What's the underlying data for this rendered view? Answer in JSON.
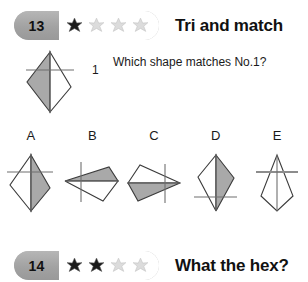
{
  "colors": {
    "shape_fill": "#a9a9a9",
    "shape_stroke": "#3b3b3b",
    "axis_line": "#7d7d7d",
    "badge_gray": "#a2a2a2",
    "star_filled": "#1a1a1a",
    "star_empty": "#d6d6d6",
    "text": "#1a1a1a"
  },
  "puzzles": [
    {
      "number": "13",
      "title": "Tri and match",
      "stars_total": 4,
      "stars_filled": 1,
      "question": "Which shape matches No.1?",
      "reference": {
        "label": "1",
        "name": "kite-left-shaded"
      },
      "options": [
        {
          "label": "A",
          "name": "kite-up-right-shaded"
        },
        {
          "label": "B",
          "name": "kite-left-top-shaded"
        },
        {
          "label": "C",
          "name": "kite-right-bottom-shaded"
        },
        {
          "label": "D",
          "name": "kite-down-right-shaded"
        },
        {
          "label": "E",
          "name": "kite-up-unshaded"
        }
      ]
    },
    {
      "number": "14",
      "title": "What the hex?",
      "stars_total": 4,
      "stars_filled": 2
    }
  ]
}
